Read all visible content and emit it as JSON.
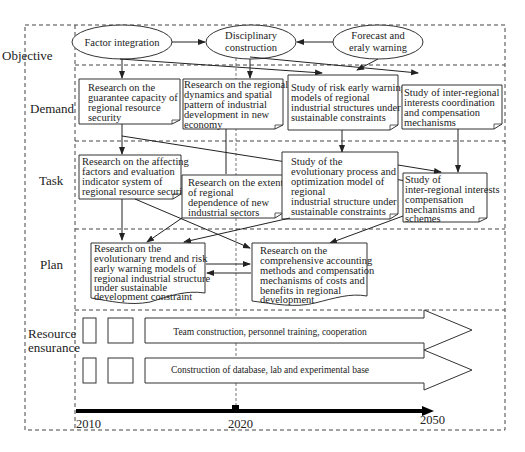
{
  "diagram": {
    "rows": [
      {
        "id": "objective",
        "label": "Objective"
      },
      {
        "id": "demand",
        "label": "Demand"
      },
      {
        "id": "task",
        "label": "Task"
      },
      {
        "id": "plan",
        "label": "Plan"
      },
      {
        "id": "resource",
        "label_line1": "Resource",
        "label_line2": "ensurance"
      }
    ],
    "objectives": [
      {
        "id": "factor",
        "lines": [
          "Factor integration"
        ]
      },
      {
        "id": "discipline",
        "lines": [
          "Disciplinary",
          "construction"
        ]
      },
      {
        "id": "forecast",
        "lines": [
          "Forecast and",
          "eraly warning"
        ]
      }
    ],
    "demand_boxes": [
      {
        "id": "d1",
        "lines": [
          "Research on the",
          "guarantee capacity of",
          "regional resource",
          "security"
        ]
      },
      {
        "id": "d2",
        "lines": [
          "Research on the regional",
          "dynamics and spatial",
          "pattern of industrial",
          "development in new",
          "economy"
        ]
      },
      {
        "id": "d3",
        "lines": [
          "Study of risk early warning",
          "models of regional",
          "industrial structures under",
          "sustainable constraints"
        ]
      },
      {
        "id": "d4",
        "lines": [
          "Study of inter-regional",
          "interests coordination",
          "and compensation",
          "mechanisms"
        ]
      }
    ],
    "task_boxes": [
      {
        "id": "t1",
        "lines": [
          "Research on the affecting",
          "factors and evaluation",
          "indicator system of",
          "regional resource security"
        ]
      },
      {
        "id": "t2",
        "lines": [
          "Research on the extent",
          "of regional",
          "dependence of new",
          "industrial sectors"
        ]
      },
      {
        "id": "t3",
        "lines": [
          "Study of the",
          "evolutionary process and",
          "optimization model of",
          "regional",
          "industrial structure under",
          "sustainable constraints"
        ]
      },
      {
        "id": "t4",
        "lines": [
          "Study of",
          "inter-regional interests",
          "compensation",
          "mechanisms and",
          "schemes"
        ]
      }
    ],
    "plan_boxes": [
      {
        "id": "p1",
        "lines": [
          "Research on the",
          "evolutionary trend and risk",
          "early warning models of",
          "regional industrial structure",
          "under sustainable",
          "development constraint"
        ]
      },
      {
        "id": "p2",
        "lines": [
          "Research on the",
          "comprehensive accounting",
          "methods and compensation",
          "mechanisms of costs and",
          "benefits in regional",
          "development"
        ]
      }
    ],
    "resources": [
      {
        "id": "r1",
        "label": "Team construction, personnel training, cooperation"
      },
      {
        "id": "r2",
        "label": "Construction of database, lab and experimental base"
      }
    ],
    "timeline": {
      "start": "2010",
      "mid": "2020",
      "end": "2050"
    },
    "colors": {
      "stroke": "#333333",
      "text": "#222222",
      "background": "#ffffff"
    }
  }
}
